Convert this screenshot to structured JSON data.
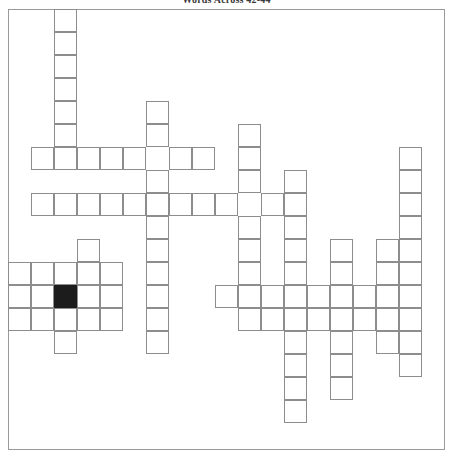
{
  "document": {
    "title": "Words Across 42-44",
    "background_color": "#ffffff",
    "line_color": "#8d8d8d",
    "block_color": "#1c1c1c"
  },
  "grid": {
    "name": "crossword-grid",
    "cell_size_px": 23,
    "origin_x_px": 8,
    "origin_y_px": 9,
    "columns": 19,
    "rows": 19,
    "frame": {
      "x": 8,
      "y": 9,
      "width": 437,
      "height": 441,
      "border_color": "#9a9a9a"
    },
    "white_cells": [
      [
        2,
        0
      ],
      [
        2,
        1
      ],
      [
        2,
        2
      ],
      [
        2,
        3
      ],
      [
        2,
        4
      ],
      [
        2,
        5
      ],
      [
        2,
        6
      ],
      [
        6,
        4
      ],
      [
        6,
        5
      ],
      [
        10,
        5
      ],
      [
        10,
        6
      ],
      [
        10,
        7
      ],
      [
        1,
        6
      ],
      [
        3,
        6
      ],
      [
        4,
        6
      ],
      [
        5,
        6
      ],
      [
        7,
        6
      ],
      [
        8,
        6
      ],
      [
        17,
        6
      ],
      [
        17,
        7
      ],
      [
        17,
        8
      ],
      [
        17,
        9
      ],
      [
        17,
        10
      ],
      [
        17,
        11
      ],
      [
        17,
        12
      ],
      [
        17,
        13
      ],
      [
        17,
        14
      ],
      [
        17,
        15
      ],
      [
        6,
        7
      ],
      [
        12,
        7
      ],
      [
        1,
        8
      ],
      [
        3,
        8
      ],
      [
        4,
        8
      ],
      [
        5,
        8
      ],
      [
        6,
        8
      ],
      [
        7,
        8
      ],
      [
        8,
        8
      ],
      [
        9,
        8
      ],
      [
        11,
        8
      ],
      [
        12,
        8
      ],
      [
        2,
        8
      ],
      [
        6,
        9
      ],
      [
        10,
        9
      ],
      [
        12,
        9
      ],
      [
        3,
        10
      ],
      [
        6,
        10
      ],
      [
        10,
        10
      ],
      [
        12,
        10
      ],
      [
        14,
        10
      ],
      [
        16,
        10
      ],
      [
        0,
        11
      ],
      [
        1,
        11
      ],
      [
        2,
        11
      ],
      [
        3,
        11
      ],
      [
        4,
        11
      ],
      [
        6,
        11
      ],
      [
        10,
        11
      ],
      [
        12,
        11
      ],
      [
        14,
        11
      ],
      [
        16,
        11
      ],
      [
        0,
        12
      ],
      [
        1,
        12
      ],
      [
        3,
        12
      ],
      [
        4,
        12
      ],
      [
        6,
        12
      ],
      [
        9,
        12
      ],
      [
        10,
        12
      ],
      [
        11,
        12
      ],
      [
        12,
        12
      ],
      [
        13,
        12
      ],
      [
        14,
        12
      ],
      [
        15,
        12
      ],
      [
        16,
        12
      ],
      [
        0,
        13
      ],
      [
        1,
        13
      ],
      [
        2,
        13
      ],
      [
        3,
        13
      ],
      [
        4,
        13
      ],
      [
        6,
        13
      ],
      [
        10,
        13
      ],
      [
        11,
        13
      ],
      [
        12,
        13
      ],
      [
        13,
        13
      ],
      [
        14,
        13
      ],
      [
        15,
        13
      ],
      [
        16,
        13
      ],
      [
        2,
        14
      ],
      [
        6,
        14
      ],
      [
        12,
        14
      ],
      [
        14,
        14
      ],
      [
        16,
        14
      ],
      [
        12,
        15
      ],
      [
        14,
        15
      ],
      [
        12,
        16
      ],
      [
        14,
        16
      ],
      [
        12,
        17
      ]
    ],
    "black_cells": [
      [
        2,
        12
      ]
    ]
  }
}
